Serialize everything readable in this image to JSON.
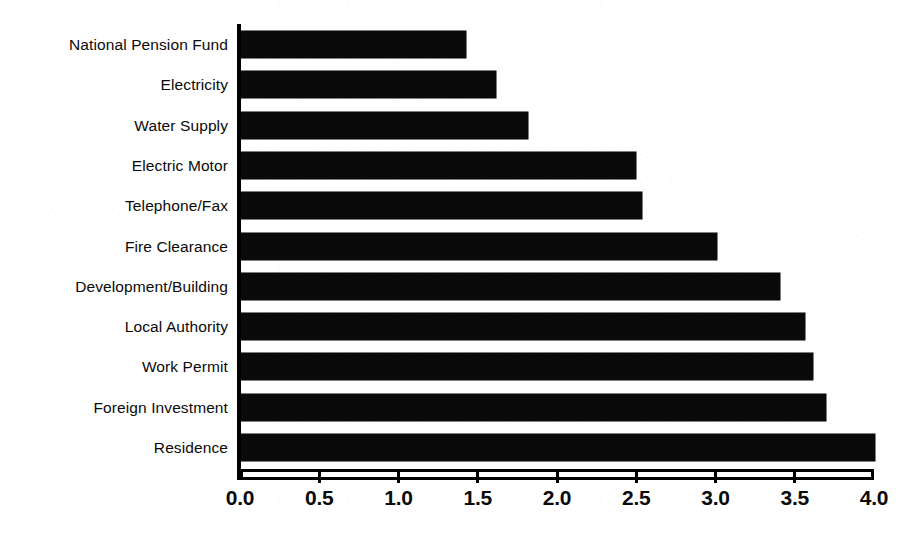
{
  "chart_data": {
    "type": "bar",
    "orientation": "horizontal",
    "title": "",
    "subtitle": "",
    "xlabel": "",
    "ylabel": "",
    "xlim": [
      0.0,
      4.0
    ],
    "xticks": [
      "0.0",
      "0.5",
      "1.0",
      "1.5",
      "2.0",
      "2.5",
      "3.0",
      "3.5",
      "4.0"
    ],
    "xtick_values": [
      0.0,
      0.5,
      1.0,
      1.5,
      2.0,
      2.5,
      3.0,
      3.5,
      4.0
    ],
    "grid": false,
    "legend": false,
    "legend_position": "none",
    "bar_color": "#0a0a0a",
    "background_color": "#ffffff",
    "categories": [
      "National Pension Fund",
      "Electricity",
      "Water Supply",
      "Electric Motor",
      "Telephone/Fax",
      "Fire Clearance",
      "Development/Building",
      "Local Authority",
      "Work Permit",
      "Foreign Investment",
      "Residence"
    ],
    "values": [
      1.42,
      1.61,
      1.81,
      2.49,
      2.53,
      3.0,
      3.4,
      3.56,
      3.61,
      3.69,
      4.0
    ],
    "bars": [
      {
        "label": "National Pension Fund",
        "value": 1.42
      },
      {
        "label": "Electricity",
        "value": 1.61
      },
      {
        "label": "Water Supply",
        "value": 1.81
      },
      {
        "label": "Electric Motor",
        "value": 2.49
      },
      {
        "label": "Telephone/Fax",
        "value": 2.53
      },
      {
        "label": "Fire Clearance",
        "value": 3.0
      },
      {
        "label": "Development/Building",
        "value": 3.4
      },
      {
        "label": "Local Authority",
        "value": 3.56
      },
      {
        "label": "Work Permit",
        "value": 3.61
      },
      {
        "label": "Foreign Investment",
        "value": 3.69
      },
      {
        "label": "Residence",
        "value": 4.0
      }
    ]
  }
}
